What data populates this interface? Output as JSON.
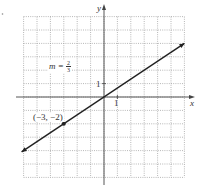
{
  "chart_data": {
    "type": "line",
    "title": "",
    "xlabel": "x",
    "ylabel": "y",
    "xlim": [
      -6,
      6
    ],
    "ylim": [
      -6,
      6
    ],
    "grid": true,
    "grid_style": "dotted",
    "tick_labels": {
      "x": [
        "1"
      ],
      "y": [
        "1"
      ]
    },
    "series": [
      {
        "name": "line",
        "equation": "y = (2/3)x",
        "slope": "2/3",
        "x": [
          -6,
          6
        ],
        "y": [
          -4,
          4
        ],
        "arrows": "both"
      }
    ],
    "points": [
      {
        "x": -3,
        "y": -2,
        "label": "(−3, −2)"
      },
      {
        "x": 0,
        "y": 0,
        "label": ""
      }
    ],
    "annotations": [
      {
        "text": "m = 2/3",
        "x": -3.5,
        "y": 2.5
      }
    ]
  },
  "labels": {
    "x_axis": "x",
    "y_axis": "y",
    "x_tick": "1",
    "y_tick": "1",
    "point_label": "(−3, −2)",
    "slope_m": "m =",
    "slope_num": "2",
    "slope_den": "3"
  },
  "colors": {
    "axis": "#444444",
    "grid": "#9a9a9a",
    "line": "#222222"
  }
}
